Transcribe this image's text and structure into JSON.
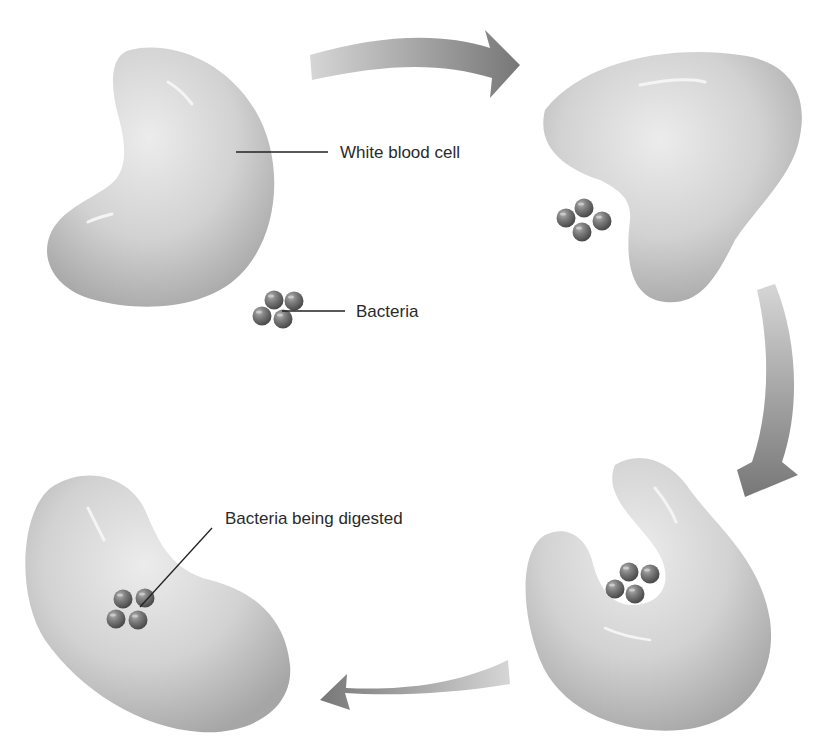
{
  "diagram": {
    "type": "process-cycle",
    "stages": [
      {
        "index": 1,
        "position": "top-left",
        "description": "White blood cell near bacteria"
      },
      {
        "index": 2,
        "position": "top-right",
        "description": "White blood cell extends toward bacteria"
      },
      {
        "index": 3,
        "position": "bottom-right",
        "description": "White blood cell surrounds bacteria"
      },
      {
        "index": 4,
        "position": "bottom-left",
        "description": "Bacteria engulfed inside cell"
      }
    ],
    "labels": {
      "white_blood_cell": "White blood cell",
      "bacteria": "Bacteria",
      "bacteria_digested": "Bacteria being digested"
    },
    "arrows": [
      {
        "from": "top-left",
        "to": "top-right",
        "direction": "right"
      },
      {
        "from": "top-right",
        "to": "bottom-right",
        "direction": "down"
      },
      {
        "from": "bottom-right",
        "to": "bottom-left",
        "direction": "left"
      }
    ],
    "colors": {
      "cell_light": "#e6e6e6",
      "cell_dark": "#a8a8a8",
      "bacteria": "#6e6e6e",
      "arrow_light": "#d2d2d2",
      "arrow_dark": "#7a7a7a",
      "text": "#2a2a2a"
    }
  }
}
